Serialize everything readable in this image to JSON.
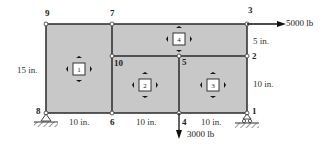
{
  "diagram": {
    "type": "finite-element-mesh",
    "colors": {
      "fill": "#c8c8c8",
      "line": "#2a2a2a",
      "node": "#ffffff",
      "text": "#222222"
    },
    "nodes": [
      {
        "id": "1",
        "x": 247,
        "y": 113
      },
      {
        "id": "2",
        "x": 247,
        "y": 56
      },
      {
        "id": "3",
        "x": 247,
        "y": 24
      },
      {
        "id": "4",
        "x": 179,
        "y": 113
      },
      {
        "id": "5",
        "x": 179,
        "y": 56
      },
      {
        "id": "6",
        "x": 112,
        "y": 113
      },
      {
        "id": "7",
        "x": 112,
        "y": 24
      },
      {
        "id": "8",
        "x": 46,
        "y": 113
      },
      {
        "id": "9",
        "x": 46,
        "y": 24
      },
      {
        "id": "10",
        "x": 112,
        "y": 56
      }
    ],
    "elements": [
      {
        "id": "1",
        "label": "1",
        "x": 79,
        "y": 69
      },
      {
        "id": "2",
        "label": "2",
        "x": 145,
        "y": 85
      },
      {
        "id": "3",
        "label": "3",
        "x": 213,
        "y": 85
      },
      {
        "id": "4",
        "label": "4",
        "x": 179,
        "y": 39
      }
    ],
    "dimensions": {
      "left_height": "15 in.",
      "right_top": "5 in.",
      "right_bottom": "10 in.",
      "bottom_1": "10 in.",
      "bottom_2": "10 in.",
      "bottom_3": "10 in."
    },
    "loads": {
      "horizontal": "5000 lb",
      "vertical": "3000 lb"
    },
    "supports": {
      "node_8": "pin",
      "node_1": "roller"
    }
  }
}
